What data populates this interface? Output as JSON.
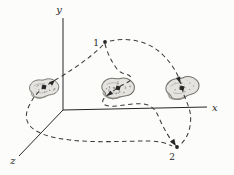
{
  "figure": {
    "axes": {
      "x_label": "x",
      "y_label": "y",
      "z_label": "z"
    },
    "points": {
      "start_label": "1",
      "end_label": "2"
    },
    "colors": {
      "background": "#fcfcfb",
      "line": "#262626",
      "dash": "#3b3b3b",
      "blob_fill": "#e4e3e0",
      "blob_stroke": "#75726c",
      "blob_shade": "#8f8c86",
      "speckle": "#9b988f"
    }
  }
}
